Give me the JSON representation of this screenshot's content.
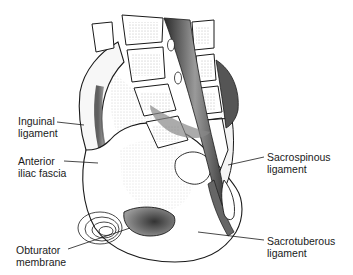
{
  "figure": {
    "labels": [
      {
        "id": "inguinal-ligament",
        "line1": "Inguinal",
        "line2": "ligament"
      },
      {
        "id": "anterior-iliac-fascia",
        "line1": "Anterior",
        "line2": "iliac fascia"
      },
      {
        "id": "obturator-membrane",
        "line1": "Obturator",
        "line2": "membrane"
      },
      {
        "id": "sacrospinous-ligament",
        "line1": "Sacrospinous",
        "line2": "ligament"
      },
      {
        "id": "sacrotuberous-ligament",
        "line1": "Sacrotuberous",
        "line2": "ligament"
      }
    ]
  },
  "colors": {
    "background": "#ffffff",
    "ink": "#1a1a1a",
    "shade_dark": "#3a3a3a",
    "shade_mid": "#8a8a8a",
    "shade_light": "#cfcfcf"
  }
}
